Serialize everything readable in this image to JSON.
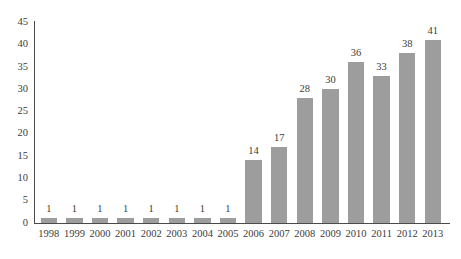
{
  "chart_data": {
    "type": "bar",
    "title": "",
    "subtitle": "",
    "xlabel": "",
    "ylabel": "",
    "categories": [
      "1998",
      "1999",
      "2000",
      "2001",
      "2002",
      "2003",
      "2004",
      "2005",
      "2006",
      "2007",
      "2008",
      "2009",
      "2010",
      "2011",
      "2012",
      "2013"
    ],
    "values": [
      1,
      1,
      1,
      1,
      1,
      1,
      1,
      1,
      14,
      17,
      28,
      30,
      36,
      33,
      38,
      41
    ],
    "data_labels": [
      "1",
      "1",
      "1",
      "1",
      "1",
      "1",
      "1",
      "1",
      "14",
      "17",
      "28",
      "30",
      "36",
      "33",
      "38",
      "41"
    ],
    "ylim": [
      0,
      45
    ],
    "yticks": [
      0,
      5,
      10,
      15,
      20,
      25,
      30,
      35,
      40,
      45
    ],
    "ytick_labels": [
      "0",
      "5",
      "10",
      "15",
      "20",
      "25",
      "30",
      "35",
      "40",
      "45"
    ],
    "grid": false,
    "legend": null,
    "legend_position": "none",
    "bar_color": "#9d9d9d",
    "axis_color": "#4a4a4a",
    "text_color": "#3c3c3c",
    "background_color": "#ffffff",
    "show_value_labels": true
  }
}
